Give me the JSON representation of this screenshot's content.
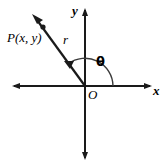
{
  "figure": {
    "background_color": "#ffffff",
    "stroke_color": "#1a1a1a",
    "labels": {
      "point": "P(x, y)",
      "radius": "r",
      "angle": "θ",
      "origin": "O",
      "axis_x": "x",
      "axis_y": "y"
    },
    "icons": {
      "point_marker": "point-dot-icon",
      "ray_arrow": "arrowhead-icon",
      "angle_arc": "arc-arrow-icon",
      "axis_arrow": "axis-arrowhead-icon"
    },
    "geometry": {
      "origin": [
        85,
        86
      ],
      "x_axis": [
        12,
        86,
        152,
        86
      ],
      "y_axis": [
        85,
        8,
        85,
        160
      ],
      "ray_end": [
        33,
        16
      ],
      "point_marker": [
        42,
        27
      ],
      "arc_radius": 28,
      "angle_degrees": 127
    }
  }
}
